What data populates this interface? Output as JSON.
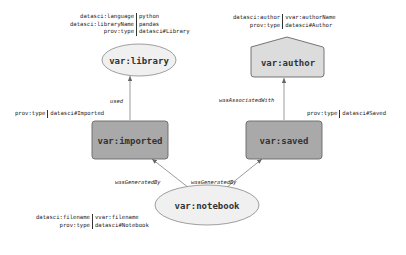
{
  "nodes": {
    "library": {
      "label": "var:library",
      "shape": "ellipse",
      "fill": "#f0f0f0",
      "attributes": [
        {
          "key": "datasci:language",
          "value": "python"
        },
        {
          "key": "datasci:libraryName",
          "value": "pandas"
        },
        {
          "key": "prov:type",
          "value": "datasci#Library"
        }
      ]
    },
    "author": {
      "label": "var:author",
      "shape": "house",
      "fill": "#dcdcdc",
      "attributes": [
        {
          "key": "datasci:author",
          "value": "vvar:authorName"
        },
        {
          "key": "prov:type",
          "value": "datasci#Author"
        }
      ]
    },
    "imported": {
      "label": "var:imported",
      "shape": "rounded-rect",
      "fill": "#a9a9a9",
      "attributes": [
        {
          "key": "prov:type",
          "value": "datasci#Imported"
        }
      ]
    },
    "saved": {
      "label": "var:saved",
      "shape": "rounded-rect",
      "fill": "#a9a9a9",
      "attributes": [
        {
          "key": "prov:type",
          "value": "datasci#Saved"
        }
      ]
    },
    "notebook": {
      "label": "var:notebook",
      "shape": "ellipse",
      "fill": "#f0f0f0",
      "attributes": [
        {
          "key": "datasci:filename",
          "value": "vvar:filename"
        },
        {
          "key": "prov:type",
          "value": "datasci#Notebook"
        }
      ]
    }
  },
  "edges": [
    {
      "from": "imported",
      "to": "library",
      "label": "used"
    },
    {
      "from": "saved",
      "to": "author",
      "label": "wasAssociatedWith"
    },
    {
      "from": "notebook",
      "to": "imported",
      "label": "wasGeneratedBy"
    },
    {
      "from": "notebook",
      "to": "saved",
      "label": "wasGeneratedBy"
    }
  ],
  "colors": {
    "stroke": "#777777",
    "edge": "#808080",
    "activity": "#a9a9a9",
    "agent": "#dcdcdc",
    "entity": "#f0f0f0"
  }
}
